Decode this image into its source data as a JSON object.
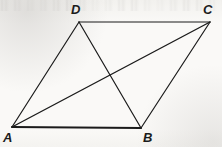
{
  "figure": {
    "kind": "geometry-diagram",
    "shape_name": "parallelogram",
    "canvas": {
      "width": 222,
      "height": 147
    },
    "background_color": "#f8f7f5",
    "ink_color": "#1b1b1b",
    "vertices": [
      {
        "id": "A",
        "label": "A",
        "x": 12,
        "y": 127,
        "label_x": 3,
        "label_y": 131
      },
      {
        "id": "B",
        "label": "B",
        "x": 141,
        "y": 128,
        "label_x": 143,
        "label_y": 131
      },
      {
        "id": "C",
        "label": "C",
        "x": 210,
        "y": 22,
        "label_x": 203,
        "label_y": 3
      },
      {
        "id": "D",
        "label": "D",
        "x": 79,
        "y": 22,
        "label_x": 71,
        "label_y": 3
      }
    ],
    "edges": [
      {
        "id": "AB",
        "from": "A",
        "to": "B",
        "role": "side",
        "stroke_width": 2.1
      },
      {
        "id": "BC",
        "from": "B",
        "to": "C",
        "role": "side",
        "stroke_width": 1.2
      },
      {
        "id": "CD",
        "from": "C",
        "to": "D",
        "role": "side",
        "stroke_width": 1.2
      },
      {
        "id": "DA",
        "from": "D",
        "to": "A",
        "role": "side",
        "stroke_width": 1.2
      },
      {
        "id": "AC",
        "from": "A",
        "to": "C",
        "role": "diagonal",
        "stroke_width": 1.4
      },
      {
        "id": "BD",
        "from": "B",
        "to": "D",
        "role": "diagonal",
        "stroke_width": 1.2
      }
    ],
    "diagonal_intersection": {
      "x": 110,
      "y": 75
    },
    "bleed_through_note": "faint illegible gray text bleed along the top edge"
  }
}
